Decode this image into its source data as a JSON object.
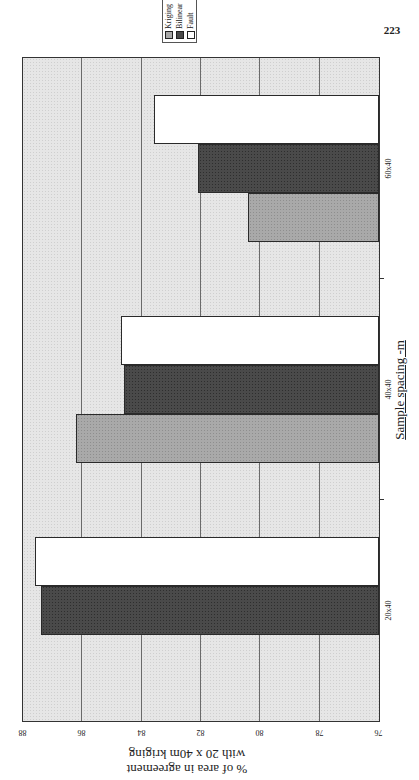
{
  "page": {
    "number": "223"
  },
  "legend": {
    "items": [
      {
        "label": "Kriging",
        "color": "#a9a9a9"
      },
      {
        "label": "Bilinear",
        "color": "#4a4a4a"
      },
      {
        "label": "Fault",
        "color": "#ffffff"
      }
    ]
  },
  "axes": {
    "y_title_line1": "% of area in agreement",
    "y_title_line2": "with 20 x 40m kriging",
    "x_title": "Sample spacing -m",
    "y_ticks": [
      "76",
      "78",
      "80",
      "82",
      "84",
      "86",
      "88"
    ],
    "categories": [
      "20x40",
      "40x40",
      "60x40"
    ]
  },
  "chart_data": {
    "type": "bar",
    "orientation": "rotated page (chart printed sideways, vertical bars)",
    "title": "",
    "xlabel": "Sample spacing -m",
    "ylabel": "% of area in agreement with 20 x 40m kriging",
    "categories": [
      "20x40",
      "40x40",
      "60x40"
    ],
    "series": [
      {
        "name": "Kriging",
        "values": [
          null,
          86.2,
          80.4
        ]
      },
      {
        "name": "Bilinear",
        "values": [
          87.4,
          84.6,
          82.1
        ]
      },
      {
        "name": "Fault",
        "values": [
          87.6,
          84.7,
          83.6
        ]
      }
    ],
    "ylim": [
      76,
      88
    ],
    "y_ticks": [
      76,
      78,
      80,
      82,
      84,
      86,
      88
    ],
    "grid": true,
    "legend_position": "top-right (outside plot)"
  }
}
